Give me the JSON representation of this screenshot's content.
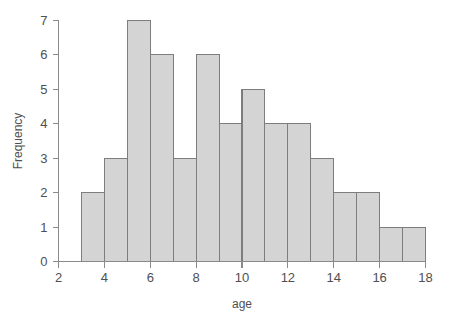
{
  "chart_data": {
    "type": "bar",
    "title": "",
    "subtitle": "",
    "xlabel": "age",
    "ylabel": "Frequency",
    "xlim": [
      2,
      18
    ],
    "ylim": [
      0,
      7
    ],
    "grid": false,
    "legend": false,
    "bin_width": 1,
    "bin_edges": [
      3,
      4,
      5,
      6,
      7,
      8,
      9,
      10,
      11,
      12,
      13,
      14,
      15,
      16,
      17,
      18
    ],
    "categories": [
      "3-4",
      "4-5",
      "5-6",
      "6-7",
      "7-8",
      "8-9",
      "9-10",
      "10-11",
      "11-12",
      "12-13",
      "13-14",
      "14-15",
      "15-16",
      "16-17",
      "17-18"
    ],
    "values": [
      2,
      3,
      7,
      6,
      3,
      6,
      4,
      5,
      4,
      4,
      3,
      2,
      2,
      1,
      1
    ],
    "x_ticks": [
      2,
      4,
      6,
      8,
      10,
      12,
      14,
      16,
      18
    ],
    "x_tick_labels": [
      "2",
      "4",
      "6",
      "8",
      "10",
      "12",
      "14",
      "16",
      "18"
    ],
    "y_ticks": [
      0,
      1,
      2,
      3,
      4,
      5,
      6,
      7
    ],
    "y_tick_labels": [
      "0",
      "1",
      "2",
      "3",
      "4",
      "5",
      "6",
      "7"
    ],
    "colors": {
      "bar_fill": "#d4d4d4",
      "bar_stroke": "#7d7d7d",
      "axis": "#8a8a8a",
      "text": "#4f4f4f",
      "background": "#ffffff"
    }
  }
}
